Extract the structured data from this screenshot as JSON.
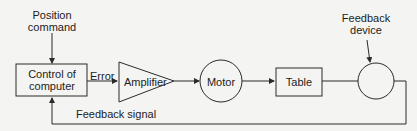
{
  "diagram": {
    "nodes": {
      "position_command": {
        "line1": "Position",
        "line2": "command"
      },
      "control": {
        "line1": "Control of",
        "line2": "computer"
      },
      "amplifier": {
        "label": "Amplifier"
      },
      "motor": {
        "label": "Motor"
      },
      "table": {
        "label": "Table"
      },
      "feedback_device": {
        "line1": "Feedback",
        "line2": "device"
      }
    },
    "edges": {
      "error": {
        "label": "Error"
      },
      "feedback_signal": {
        "label": "Feedback signal"
      }
    },
    "colors": {
      "line": "#2a2a2a",
      "background": "#f4f4f2"
    }
  }
}
